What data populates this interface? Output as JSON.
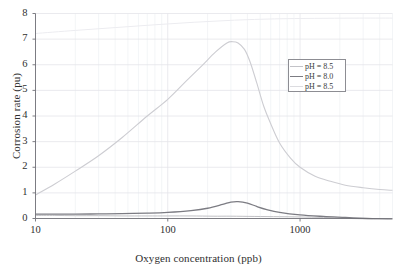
{
  "chart_data": {
    "type": "line",
    "title": "",
    "xlabel": "Oxygen concentration (ppb)",
    "ylabel": "Corrosion rate (pu)",
    "xscale": "log",
    "xlim": [
      10,
      5000
    ],
    "ylim": [
      0,
      8
    ],
    "xticks": [
      10,
      100,
      1000
    ],
    "xtick_labels": [
      "10",
      "100",
      "1000"
    ],
    "yticks": [
      0,
      1,
      2,
      3,
      4,
      5,
      6,
      7,
      8
    ],
    "ytick_labels": [
      "0",
      "1",
      "2",
      "3",
      "4",
      "5",
      "6",
      "7",
      "8"
    ],
    "grid": true,
    "legend_position": "upper right",
    "series": [
      {
        "name": "pH = 8.5",
        "color": "#b9b9bd",
        "width": 0.9,
        "x": [
          10,
          14,
          20,
          30,
          45,
          70,
          100,
          150,
          220,
          300,
          450,
          700,
          1000,
          1500,
          2200,
          3200,
          5000
        ],
        "values": [
          0.12,
          0.12,
          0.11,
          0.11,
          0.1,
          0.1,
          0.1,
          0.1,
          0.09,
          0.09,
          0.08,
          0.07,
          0.06,
          0.04,
          0.01,
          -0.03,
          -0.08
        ]
      },
      {
        "name": "pH = 8.0",
        "color": "#7c7c83",
        "width": 1.3,
        "x": [
          10,
          14,
          20,
          30,
          45,
          70,
          100,
          150,
          200,
          260,
          300,
          340,
          400,
          470,
          560,
          700,
          1000,
          1500,
          2200,
          3200,
          5000
        ],
        "values": [
          0.17,
          0.17,
          0.17,
          0.18,
          0.19,
          0.21,
          0.24,
          0.31,
          0.4,
          0.55,
          0.64,
          0.66,
          0.6,
          0.47,
          0.35,
          0.24,
          0.14,
          0.08,
          0.04,
          0.0,
          -0.04
        ]
      },
      {
        "name": "pH = 8.5",
        "color": "#cdcdd2",
        "width": 1.1,
        "x": [
          10,
          14,
          20,
          30,
          45,
          70,
          100,
          140,
          180,
          230,
          280,
          310,
          340,
          380,
          420,
          470,
          530,
          600,
          700,
          850,
          1000,
          1300,
          1700,
          2200,
          3000,
          4000,
          5000
        ],
        "values": [
          0.92,
          1.35,
          1.85,
          2.45,
          3.15,
          4.0,
          4.65,
          5.4,
          5.95,
          6.5,
          6.85,
          6.9,
          6.85,
          6.6,
          6.1,
          5.3,
          4.4,
          3.7,
          2.95,
          2.35,
          2.0,
          1.65,
          1.45,
          1.3,
          1.2,
          1.13,
          1.1
        ]
      },
      {
        "name": "upper-faint-curve",
        "color": "#ececf0",
        "width": 1.0,
        "x": [
          10,
          20,
          40,
          80,
          160,
          320,
          640,
          1280,
          2560,
          5000
        ],
        "values": [
          7.22,
          7.34,
          7.45,
          7.56,
          7.66,
          7.74,
          7.79,
          7.81,
          7.82,
          7.82
        ]
      }
    ],
    "legend_entries": [
      {
        "label": "pH = 8.5",
        "color": "#c3c3c8"
      },
      {
        "label": "pH = 8.0",
        "color": "#7c7c83"
      },
      {
        "label": "pH = 8.5",
        "color": "#dcdce0"
      }
    ]
  },
  "colors": {
    "axis": "#6f6f76",
    "grid": "#e4e4ea",
    "grid_minor": "#eef0f4",
    "text": "#2f2f2f",
    "legend_border": "#8d8d93",
    "background": "#ffffff"
  }
}
